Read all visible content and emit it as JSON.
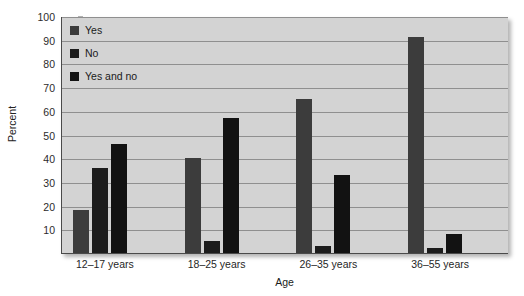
{
  "chart_data": {
    "type": "bar",
    "title": "",
    "xlabel": "Age",
    "ylabel": "Percent",
    "categories": [
      "12–17 years",
      "18–25 years",
      "26–35 years",
      "36–55 years"
    ],
    "series": [
      {
        "name": "Yes",
        "color": "#3c3c3c",
        "values": [
          18,
          40,
          65,
          91
        ]
      },
      {
        "name": "No",
        "color": "#1c1c1c",
        "values": [
          36,
          5,
          3,
          2
        ]
      },
      {
        "name": "Yes and no",
        "color": "#121212",
        "values": [
          46,
          57,
          33,
          8
        ]
      }
    ],
    "ylim": [
      0,
      100
    ],
    "yticks": [
      10,
      20,
      30,
      40,
      50,
      60,
      70,
      80,
      90,
      100
    ],
    "ytick_labels": [
      "10",
      "20",
      "30",
      "40",
      "50",
      "60",
      "70",
      "80",
      "90",
      "100"
    ],
    "grid": true,
    "legend_position": "top-left",
    "plot_background": "#d3d3d3",
    "gridline_color": "#8f8f8f",
    "axis_color": "#4a4a4a"
  }
}
